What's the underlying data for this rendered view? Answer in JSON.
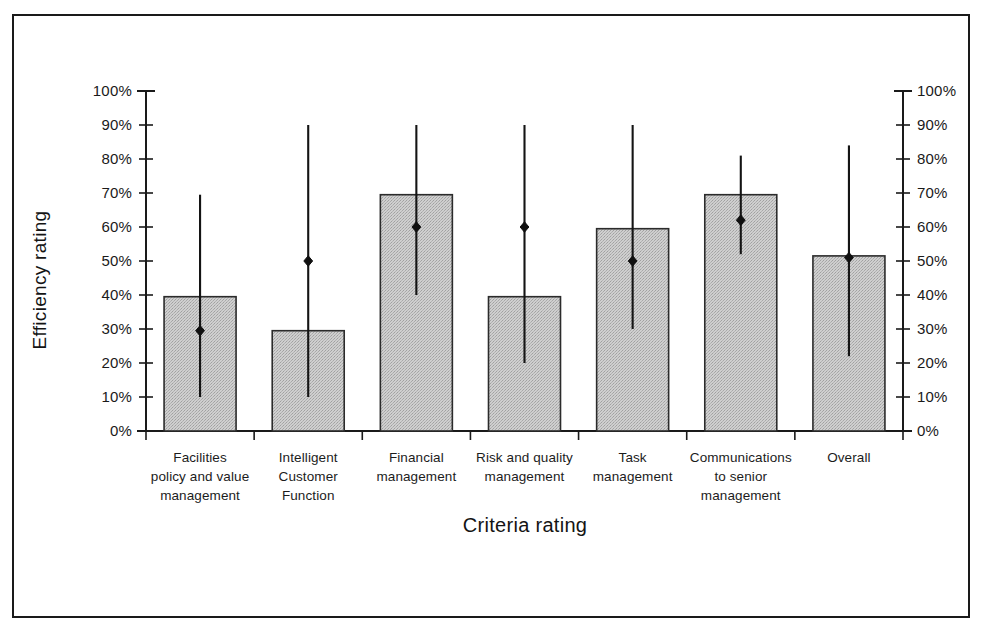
{
  "chart_data": {
    "type": "bar",
    "title": "",
    "subtitle": "",
    "xlabel": "Criteria rating",
    "ylabel": "Efficiency rating",
    "ylim": [
      0,
      100
    ],
    "y_tick_labels": [
      "100%",
      "90%",
      "80%",
      "70%",
      "60%",
      "50%",
      "40%",
      "30%",
      "20%",
      "10%",
      "0%"
    ],
    "y_tick_values": [
      100,
      90,
      80,
      70,
      60,
      50,
      40,
      30,
      20,
      10,
      0
    ],
    "y_axis_duplicated_right": true,
    "grid": false,
    "legend": "none",
    "units": "percent",
    "categories": [
      "Facilities policy and value management",
      "Intelligent Customer Function",
      "Financial management",
      "Risk and quality management",
      "Task management",
      "Communications to senior management",
      "Overall"
    ],
    "category_label_lines": [
      [
        "Facilities",
        "policy and value",
        "management"
      ],
      [
        "Intelligent",
        "Customer",
        "Function"
      ],
      [
        "Financial",
        "management"
      ],
      [
        "Risk and quality",
        "management"
      ],
      [
        "Task",
        "management"
      ],
      [
        "Communications",
        "to senior",
        "management"
      ],
      [
        "Overall"
      ]
    ],
    "series": [
      {
        "name": "Efficiency rating (bar)",
        "values": [
          39.5,
          29.5,
          69.5,
          39.5,
          59.5,
          69.5,
          51.5
        ]
      },
      {
        "name": "Marker (point)",
        "values": [
          29.5,
          50,
          60,
          60,
          50,
          62,
          51
        ]
      }
    ],
    "error_bars": [
      {
        "low": 10,
        "high": 69.5
      },
      {
        "low": 10,
        "high": 90
      },
      {
        "low": 40,
        "high": 90
      },
      {
        "low": 20,
        "high": 90
      },
      {
        "low": 30,
        "high": 90
      },
      {
        "low": 52,
        "high": 81
      },
      {
        "low": 22,
        "high": 84
      }
    ],
    "colors": {
      "bar_fill": "#c9c9c9",
      "bar_edge": "#2b2b2b",
      "error_line": "#141414",
      "marker": "#101010",
      "axis": "#1a1a1a",
      "frame": "#1a1a1a",
      "background": "#ffffff"
    }
  }
}
